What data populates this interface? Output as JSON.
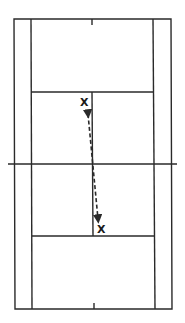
{
  "diagram": {
    "type": "badminton-court-drill",
    "line_color": "#2a2a2a",
    "markers": [
      {
        "label": "X",
        "position": "upper-left-service-box",
        "x": 84,
        "y": 106
      },
      {
        "label": "X",
        "position": "lower-right-service-box",
        "x": 102,
        "y": 233
      }
    ],
    "movement": {
      "style": "dashed",
      "arrowheads": "both",
      "from": [
        88,
        112
      ],
      "to": [
        98,
        221
      ]
    }
  }
}
